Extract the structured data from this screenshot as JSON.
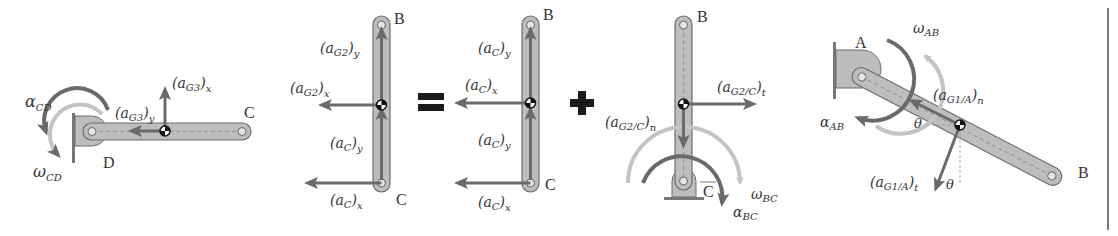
{
  "colors": {
    "link_fill": "#bdbdbd",
    "link_stroke": "#6e6e6e",
    "vector_dark": "#6a6a6a",
    "arc_dark": "#6a6a6a",
    "arc_light": "#c4c4c4",
    "operator": "#1a1a1a",
    "text": "#333333",
    "divider": "#7a7a7a"
  },
  "panels": [
    {
      "id": "link-CD",
      "points": {
        "D": "D",
        "C": "C"
      },
      "labels": {
        "alpha": "α",
        "alpha_sub": "CD",
        "omega": "ω",
        "omega_sub": "CD",
        "aG3x_main": "(a",
        "aG3x_sub": "G3",
        "aG3x_close": ")",
        "aG3x_outer": "x",
        "aG3y_main": "(a",
        "aG3y_sub": "G3",
        "aG3y_close": ")",
        "aG3y_outer": "y"
      }
    },
    {
      "id": "link-BC-total",
      "points": {
        "B": "B",
        "C": "C"
      },
      "labels": {
        "aG2y_main": "(a",
        "aG2y_sub": "G2",
        "aG2y_close": ")",
        "aG2y_outer": "y",
        "aG2x_main": "(a",
        "aG2x_sub": "G2",
        "aG2x_close": ")",
        "aG2x_outer": "x",
        "aCy_main": "(a",
        "aCy_sub": "C",
        "aCy_close": ")",
        "aCy_outer": "y",
        "aCx_main": "(a",
        "aCx_sub": "C",
        "aCx_close": ")",
        "aCx_outer": "x"
      }
    },
    {
      "id": "operator-equals",
      "symbol": "="
    },
    {
      "id": "link-BC-translation",
      "points": {
        "B": "B",
        "C": "C"
      },
      "labels": {
        "aCy_top_main": "(a",
        "aCy_top_sub": "C",
        "aCy_top_close": ")",
        "aCy_top_outer": "y",
        "aCx_mid_main": "(a",
        "aCx_mid_sub": "C",
        "aCx_mid_close": ")",
        "aCx_mid_outer": "x",
        "aCy_bot_main": "(a",
        "aCy_bot_sub": "C",
        "aCy_bot_close": ")",
        "aCy_bot_outer": "y",
        "aCx_bot_main": "(a",
        "aCx_bot_sub": "C",
        "aCx_bot_close": ")",
        "aCx_bot_outer": "x"
      }
    },
    {
      "id": "operator-plus",
      "symbol": "+"
    },
    {
      "id": "link-BC-rotation",
      "points": {
        "B": "B",
        "C": "C"
      },
      "labels": {
        "aG2Ct_main": "(a",
        "aG2Ct_sub": "G2/C",
        "aG2Ct_close": ")",
        "aG2Ct_outer": "t",
        "aG2Cn_main": "(a",
        "aG2Cn_sub": "G2/C",
        "aG2Cn_close": ")",
        "aG2Cn_outer": "n",
        "omega": "ω",
        "omega_sub": "BC",
        "alpha": "α",
        "alpha_sub": "BC"
      }
    },
    {
      "id": "link-AB",
      "points": {
        "A": "A",
        "B": "B"
      },
      "labels": {
        "omega": "ω",
        "omega_sub": "AB",
        "alpha": "α",
        "alpha_sub": "AB",
        "aG1An_main": "(a",
        "aG1An_sub": "G1/A",
        "aG1An_close": ")",
        "aG1An_outer": "n",
        "aG1At_main": "(a",
        "aG1At_sub": "G1/A",
        "aG1At_close": ")",
        "aG1At_outer": "t",
        "theta1": "θ",
        "theta2": "θ"
      }
    }
  ]
}
